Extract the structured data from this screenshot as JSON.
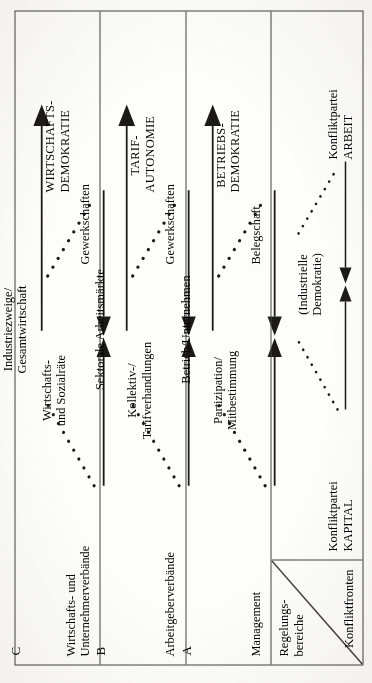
{
  "figure": {
    "orientation": "rotated-90-ccw",
    "corner": {
      "top_label": "Regelungs-\nbereiche",
      "bottom_label": "Konfliktfronten"
    },
    "rows": [
      {
        "letter": "C",
        "scope": "Industriezweige/\nGesamtwirtschaft",
        "left_actor": "Wirtschafts- und\nUnternehmerverbände",
        "center_topic": "Wirtschafts-\nund Sozialräte",
        "right_actor": "Gewerkschaften",
        "outcome": "WIRTSCHAFTS-\nDEMOKRATIE"
      },
      {
        "letter": "B",
        "scope": "Sektorale Arbeitsmärkte",
        "left_actor": "Arbeitgeberverbände",
        "center_topic": "Kollektiv-/\nTarifverhandlungen",
        "right_actor": "Gewerkschaften",
        "outcome": "TARIF-\nAUTONOMIE"
      },
      {
        "letter": "A",
        "scope": "Betrieb/Unternehmen",
        "left_actor": "Management",
        "center_topic": "Partizipation/\nMitbestimmung",
        "right_actor": "Belegschaft",
        "outcome": "BETRIEBS-\nDEMOKRATIE"
      }
    ],
    "conflict_row": {
      "left_actor": "Konfliktpartei\nKAPITAL",
      "center_topic": "(Industrielle\nDemokratie)",
      "right_actor": "Konfliktpartei\nARBEIT"
    },
    "colors": {
      "ink": "#1b1a18",
      "rule": "#43423f",
      "paper": "#fdfdfc"
    }
  }
}
